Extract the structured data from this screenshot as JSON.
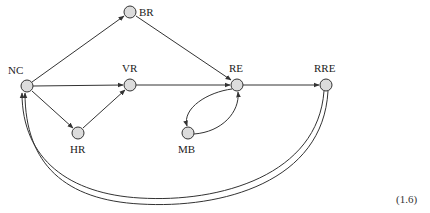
{
  "diagram": {
    "type": "directed-graph",
    "equation_number": "(1.6)",
    "nodes": [
      {
        "id": "NC",
        "label": "NC",
        "x": 27,
        "y": 86
      },
      {
        "id": "BR",
        "label": "BR",
        "x": 130,
        "y": 12
      },
      {
        "id": "VR",
        "label": "VR",
        "x": 130,
        "y": 85
      },
      {
        "id": "HR",
        "label": "HR",
        "x": 78,
        "y": 133
      },
      {
        "id": "RE",
        "label": "RE",
        "x": 237,
        "y": 85
      },
      {
        "id": "MB",
        "label": "MB",
        "x": 188,
        "y": 133
      },
      {
        "id": "RRE",
        "label": "RRE",
        "x": 326,
        "y": 85
      }
    ],
    "edges": [
      {
        "from": "NC",
        "to": "BR",
        "style": "single"
      },
      {
        "from": "NC",
        "to": "VR",
        "style": "single"
      },
      {
        "from": "NC",
        "to": "HR",
        "style": "single"
      },
      {
        "from": "HR",
        "to": "VR",
        "style": "single"
      },
      {
        "from": "BR",
        "to": "RE",
        "style": "single"
      },
      {
        "from": "VR",
        "to": "RE",
        "style": "single"
      },
      {
        "from": "RE",
        "to": "MB",
        "style": "curved"
      },
      {
        "from": "MB",
        "to": "RE",
        "style": "curved"
      },
      {
        "from": "RE",
        "to": "RRE",
        "style": "single"
      },
      {
        "from": "RRE",
        "to": "NC",
        "style": "double"
      }
    ]
  }
}
